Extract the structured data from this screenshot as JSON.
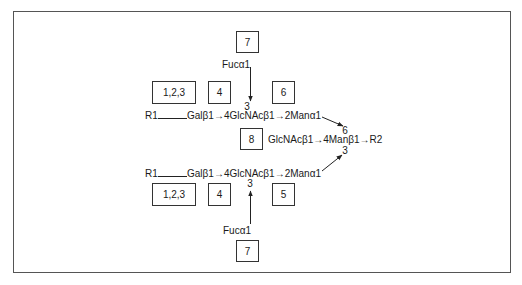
{
  "diagram": {
    "type": "glycan-structure",
    "boxes": {
      "top_7": "7",
      "upper_123": "1,2,3",
      "upper_4": "4",
      "upper_6": "6",
      "middle_8": "8",
      "lower_123": "1,2,3",
      "lower_4": "4",
      "lower_5": "5",
      "bottom_7": "7"
    },
    "upper_branch": {
      "r1": "R1",
      "chain": "Galβ1→4GlcNAcβ1→2Manα1",
      "fucose": "Fucα1",
      "fucose_link": "3"
    },
    "core": {
      "chain": "GlcNAcβ1→4Manβ1→R2",
      "link_upper": "6",
      "link_lower": "3"
    },
    "lower_branch": {
      "r1": "R1",
      "chain": "Galβ1→4GlcNAcβ1→2Manα1",
      "fucose": "Fucα1",
      "fucose_link": "3"
    }
  }
}
